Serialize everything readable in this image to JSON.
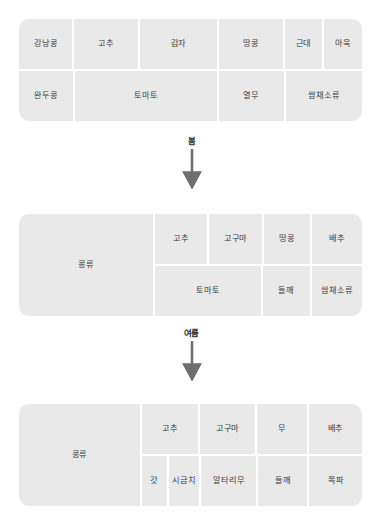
{
  "diagram": {
    "type": "crop-rotation-flow",
    "colors": {
      "cell_fill": "#e9e9e9",
      "cell_gap": "#ffffff",
      "text": "#3c3c3c",
      "arrow": "#6e6e6e",
      "background": "#ffffff"
    },
    "blocks": [
      {
        "id": "block-1",
        "span_cell": null,
        "rows": [
          [
            {
              "label": "강낭콩",
              "flex": 1.02
            },
            {
              "label": "고추",
              "flex": 1.22
            },
            {
              "label": "감자",
              "flex": 1.46
            },
            {
              "label": "땅콩",
              "flex": 1.22
            },
            {
              "label": "근대",
              "flex": 0.72
            },
            {
              "label": "아욱",
              "flex": 0.72
            }
          ],
          [
            {
              "label": "완두콩",
              "flex": 1.02
            },
            {
              "label": "토마토",
              "flex": 2.68
            },
            {
              "label": "열무",
              "flex": 1.22
            },
            {
              "label": "쌈채소류",
              "flex": 1.44
            }
          ]
        ]
      },
      {
        "id": "block-2",
        "span_cell": {
          "label": "콩류",
          "flex": 1.05
        },
        "rows": [
          [
            {
              "label": "고추",
              "flex": 1.3
            },
            {
              "label": "고구마",
              "flex": 1.3
            },
            {
              "label": "땅콩",
              "flex": 1.16
            },
            {
              "label": "배추",
              "flex": 1.24
            }
          ],
          [
            {
              "label": "토마토",
              "flex": 2.6
            },
            {
              "label": "들깨",
              "flex": 1.16
            },
            {
              "label": "쌈채소류",
              "flex": 1.24
            }
          ]
        ]
      },
      {
        "id": "block-3",
        "span_cell": {
          "label": "콩류",
          "flex": 1.05
        },
        "rows": [
          [
            {
              "label": "고추",
              "flex": 1.3
            },
            {
              "label": "고구마",
              "flex": 1.3
            },
            {
              "label": "무",
              "flex": 1.16
            },
            {
              "label": "배추",
              "flex": 1.24
            }
          ],
          [
            {
              "label": "갓",
              "flex": 0.58
            },
            {
              "label": "시금치",
              "flex": 0.72
            },
            {
              "label": "알타리무",
              "flex": 1.3
            },
            {
              "label": "들깨",
              "flex": 1.16
            },
            {
              "label": "쪽파",
              "flex": 1.24
            }
          ]
        ]
      }
    ],
    "connectors": [
      {
        "id": "connector-1",
        "label": "봄"
      },
      {
        "id": "connector-2",
        "label": "여름"
      }
    ]
  }
}
